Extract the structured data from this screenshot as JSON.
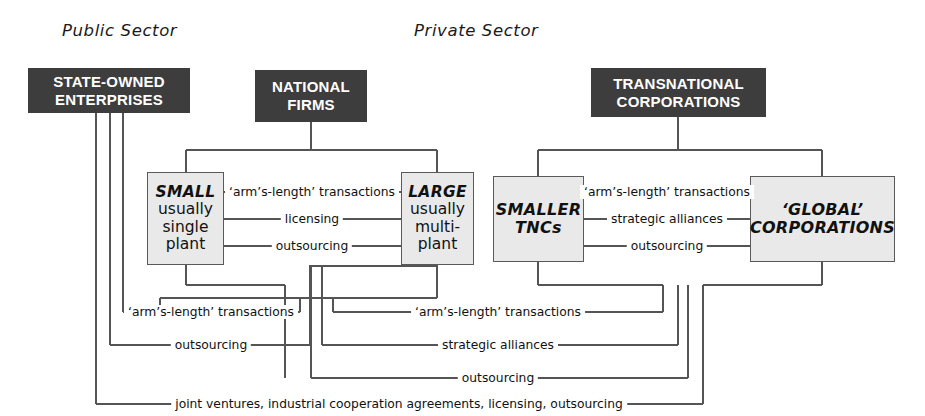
{
  "diagram": {
    "title_sectors": [
      {
        "id": "public",
        "label": "Public Sector"
      },
      {
        "id": "private",
        "label": "Private Sector"
      }
    ],
    "header_boxes": [
      {
        "id": "state-owned-enterprises",
        "line1": "STATE-OWNED",
        "line2": "ENTERPRISES"
      },
      {
        "id": "national-firms",
        "line1": "NATIONAL",
        "line2": "FIRMS"
      },
      {
        "id": "transnational-corporations",
        "line1": "TRANSNATIONAL",
        "line2": "CORPORATIONS"
      }
    ],
    "entity_boxes": [
      {
        "id": "small-firm",
        "emph": "SMALL",
        "lines": [
          "usually",
          "single",
          "plant"
        ]
      },
      {
        "id": "large-firm",
        "emph": "LARGE",
        "lines": [
          "usually",
          "multi-",
          "plant"
        ]
      },
      {
        "id": "smaller-tncs",
        "line1": "SMALLER",
        "line2": "TNCs"
      },
      {
        "id": "global-corporations",
        "line1": "‘GLOBAL’",
        "line2": "CORPORATIONS"
      }
    ],
    "link_labels": {
      "small_large": [
        "‘arm’s-length’ transactions",
        "licensing",
        "outsourcing"
      ],
      "tnc_global": [
        "‘arm’s-length’ transactions",
        "strategic alliances",
        "outsourcing"
      ],
      "lower_left": [
        "‘arm’s-length’ transactions",
        "outsourcing"
      ],
      "lower_right": [
        "‘arm’s-length’ transactions",
        "strategic alliances",
        "outsourcing"
      ],
      "bottom": "joint ventures, industrial cooperation agreements, licensing, outsourcing"
    },
    "colors": {
      "header_box_fill": "#3d3d3d",
      "header_box_text": "#ffffff",
      "entity_box_fill": "#e9e9e9",
      "entity_box_border": "#5a5a5a",
      "line": "#555555",
      "page_background": "#ffffff",
      "text": "#111111"
    }
  }
}
